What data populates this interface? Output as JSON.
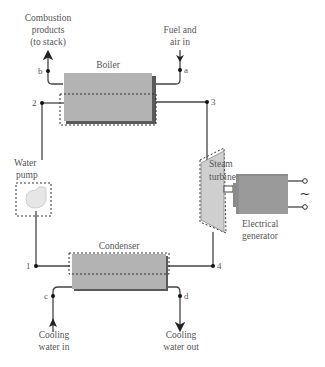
{
  "components": {
    "boiler": {
      "label": "Boiler"
    },
    "steam_turbine": {
      "label_line1": "Steam",
      "label_line2": "turbine"
    },
    "water_pump": {
      "label_line1": "Water",
      "label_line2": "pump"
    },
    "condenser": {
      "label": "Condenser"
    },
    "electrical_generator": {
      "label_line1": "Electrical",
      "label_line2": "generator",
      "ac_symbol": "~"
    }
  },
  "streams": {
    "combustion_products": {
      "line1": "Combustion",
      "line2": "products",
      "line3": "(to stack)"
    },
    "fuel_air": {
      "line1": "Fuel and",
      "line2": "air in"
    },
    "cooling_in": {
      "line1": "Cooling",
      "line2": "water in"
    },
    "cooling_out": {
      "line1": "Cooling",
      "line2": "water out"
    }
  },
  "state_points": {
    "p1": "1",
    "p2": "2",
    "p3": "3",
    "p4": "4",
    "a": "a",
    "b": "b",
    "c": "c",
    "d": "d"
  },
  "colors": {
    "equipment_fill": "#b3b3b3",
    "equipment_shadow": "#5a5a5a",
    "pump_fill": "#e6e6e6",
    "line": "#444444"
  }
}
